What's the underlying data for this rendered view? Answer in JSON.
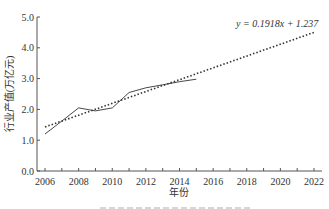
{
  "chart_data": {
    "type": "line",
    "title": "",
    "xlabel": "年份",
    "ylabel": "行业产值(万亿元)",
    "xlim": [
      2006,
      2022
    ],
    "ylim": [
      0,
      5.0
    ],
    "x_ticks": [
      2006,
      2007,
      2008,
      2009,
      2010,
      2011,
      2012,
      2013,
      2014,
      2015,
      2016,
      2017,
      2018,
      2019,
      2020,
      2021,
      2022
    ],
    "x_tick_labels": [
      "2006",
      "2008",
      "2010",
      "2012",
      "2014",
      "2016",
      "2018",
      "2020",
      "2022"
    ],
    "y_tick_labels": [
      "0.0",
      "1.0",
      "2.0",
      "3.0",
      "4.0",
      "5.0"
    ],
    "grid": false,
    "legend": null,
    "series": [
      {
        "name": "actual",
        "style": "solid",
        "x": [
          2006,
          2007,
          2008,
          2009,
          2010,
          2011,
          2012,
          2013,
          2014,
          2015
        ],
        "values": [
          1.2,
          1.62,
          2.05,
          1.95,
          2.05,
          2.55,
          2.7,
          2.8,
          2.9,
          2.98
        ]
      },
      {
        "name": "linear trend",
        "style": "dotted",
        "equation": "y = 0.1918x + 1.237",
        "x": [
          2006,
          2022
        ],
        "values": [
          1.43,
          4.5
        ]
      }
    ],
    "annotations": [
      {
        "text": "y = 0.1918x + 1.237",
        "x": 2017.3,
        "y": 4.8
      }
    ]
  }
}
